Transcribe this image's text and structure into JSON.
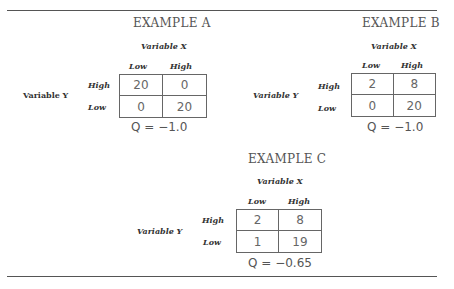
{
  "examples": {
    "a": {
      "title": "EXAMPLE A",
      "var_x": "Variable X",
      "var_y": "Variable Y",
      "col_headers": [
        "Low",
        "High"
      ],
      "row_headers": [
        "High",
        "Low"
      ],
      "cells": [
        [
          "20",
          "0"
        ],
        [
          "0",
          "20"
        ]
      ],
      "q": "Q = −1.0"
    },
    "b": {
      "title": "EXAMPLE B",
      "var_x": "Variable X",
      "var_y": "Variable Y",
      "col_headers": [
        "Low",
        "High"
      ],
      "row_headers": [
        "High",
        "Low"
      ],
      "cells": [
        [
          "2",
          "8"
        ],
        [
          "0",
          "20"
        ]
      ],
      "q": "Q = −1.0"
    },
    "c": {
      "title": "EXAMPLE C",
      "var_x": "Variable X",
      "var_y": "Variable Y",
      "col_headers": [
        "Low",
        "High"
      ],
      "row_headers": [
        "High",
        "Low"
      ],
      "cells": [
        [
          "2",
          "8"
        ],
        [
          "1",
          "19"
        ]
      ],
      "q": "Q = −0.65"
    }
  }
}
